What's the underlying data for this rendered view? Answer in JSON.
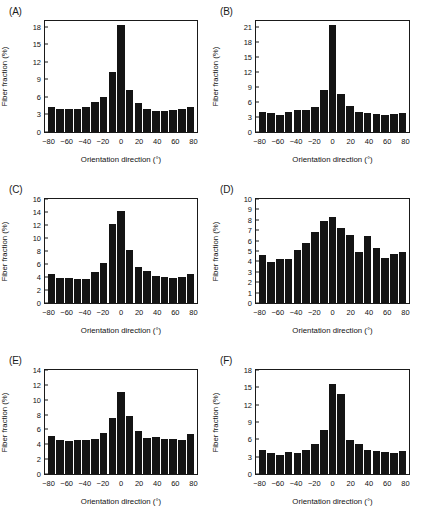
{
  "figure": {
    "panel_count": 6,
    "bin_centers": [
      -80,
      -70,
      -60,
      -50,
      -40,
      -30,
      -20,
      -10,
      0,
      10,
      20,
      30,
      40,
      50,
      60,
      70,
      80
    ]
  },
  "chart_data": [
    {
      "type": "bar",
      "panel": "(A)",
      "title": "",
      "xlabel": "Orientation direction (°)",
      "ylabel": "Fiber fraction (%)",
      "categories": [
        -80,
        -70,
        -60,
        -50,
        -40,
        -30,
        -20,
        -10,
        0,
        10,
        20,
        30,
        40,
        50,
        60,
        70,
        80
      ],
      "values": [
        4.2,
        3.9,
        3.9,
        3.9,
        4.3,
        5.1,
        6.0,
        10.2,
        18.3,
        7.2,
        4.9,
        4.0,
        3.6,
        3.6,
        3.8,
        3.9,
        4.2
      ],
      "ylim": [
        0,
        19
      ],
      "yticks": [
        0,
        3,
        6,
        9,
        12,
        15,
        18
      ],
      "xlim": [
        -85,
        85
      ],
      "xticks": [
        -80,
        -60,
        -40,
        -20,
        0,
        20,
        40,
        60,
        80
      ],
      "xtick_labels": [
        "−80",
        "−60",
        "−40",
        "−20",
        "0",
        "20",
        "40",
        "60",
        "80"
      ],
      "grid": false,
      "legend": "none",
      "bar_color": "#141414"
    },
    {
      "type": "bar",
      "panel": "(B)",
      "title": "",
      "xlabel": "Orientation direction (°)",
      "ylabel": "Fiber fraction (%)",
      "categories": [
        -80,
        -70,
        -60,
        -50,
        -40,
        -30,
        -20,
        -10,
        0,
        10,
        20,
        30,
        40,
        50,
        60,
        70,
        80
      ],
      "values": [
        4.0,
        3.9,
        3.5,
        4.0,
        4.4,
        4.5,
        5.1,
        8.5,
        21.4,
        7.7,
        5.3,
        4.0,
        3.9,
        3.7,
        3.5,
        3.7,
        3.9
      ],
      "ylim": [
        0,
        22.3
      ],
      "yticks": [
        0,
        3,
        6,
        9,
        12,
        15,
        18,
        21
      ],
      "xlim": [
        -85,
        85
      ],
      "xticks": [
        -80,
        -60,
        -40,
        -20,
        0,
        20,
        40,
        60,
        80
      ],
      "xtick_labels": [
        "−80",
        "−60",
        "−40",
        "−20",
        "0",
        "20",
        "40",
        "60",
        "80"
      ],
      "grid": false,
      "legend": "none",
      "bar_color": "#141414"
    },
    {
      "type": "bar",
      "panel": "(C)",
      "title": "",
      "xlabel": "Orientation direction (°)",
      "ylabel": "Fiber fraction (%)",
      "categories": [
        -80,
        -70,
        -60,
        -50,
        -40,
        -30,
        -20,
        -10,
        0,
        10,
        20,
        30,
        40,
        50,
        60,
        70,
        80
      ],
      "values": [
        4.4,
        3.8,
        3.8,
        3.7,
        3.65,
        4.8,
        6.15,
        12.1,
        14.2,
        8.15,
        5.5,
        5.0,
        4.1,
        3.95,
        3.8,
        4.05,
        4.5
      ],
      "ylim": [
        0,
        16
      ],
      "yticks": [
        0,
        2,
        4,
        6,
        8,
        10,
        12,
        14,
        16
      ],
      "xlim": [
        -85,
        85
      ],
      "xticks": [
        -80,
        -60,
        -40,
        -20,
        0,
        20,
        40,
        60,
        80
      ],
      "xtick_labels": [
        "−80",
        "−60",
        "−40",
        "−20",
        "0",
        "20",
        "40",
        "60",
        "80"
      ],
      "grid": false,
      "legend": "none",
      "bar_color": "#141414"
    },
    {
      "type": "bar",
      "panel": "(D)",
      "title": "",
      "xlabel": "Orientation direction (°)",
      "ylabel": "Fiber fraction (%)",
      "categories": [
        -80,
        -70,
        -60,
        -50,
        -40,
        -30,
        -20,
        -10,
        0,
        10,
        20,
        30,
        40,
        50,
        60,
        70,
        80
      ],
      "values": [
        4.6,
        3.95,
        4.25,
        4.2,
        5.1,
        5.75,
        6.8,
        7.9,
        8.25,
        7.2,
        6.5,
        4.9,
        6.45,
        5.25,
        4.3,
        4.75,
        4.9
      ],
      "ylim": [
        0,
        10
      ],
      "yticks": [
        0,
        1,
        2,
        3,
        4,
        5,
        6,
        7,
        8,
        9,
        10
      ],
      "xlim": [
        -85,
        85
      ],
      "xticks": [
        -80,
        -60,
        -40,
        -20,
        0,
        20,
        40,
        60,
        80
      ],
      "xtick_labels": [
        "−80",
        "−60",
        "−40",
        "−20",
        "0",
        "20",
        "40",
        "60",
        "80"
      ],
      "grid": false,
      "legend": "none",
      "bar_color": "#141414"
    },
    {
      "type": "bar",
      "panel": "(E)",
      "title": "",
      "xlabel": "Orientation direction (°)",
      "ylabel": "Fiber fraction (%)",
      "categories": [
        -80,
        -70,
        -60,
        -50,
        -40,
        -30,
        -20,
        -10,
        0,
        10,
        20,
        30,
        40,
        50,
        60,
        70,
        80
      ],
      "values": [
        5.1,
        4.6,
        4.45,
        4.6,
        4.55,
        4.7,
        5.55,
        7.5,
        11.1,
        7.8,
        5.75,
        4.85,
        5.0,
        4.7,
        4.7,
        4.55,
        5.35
      ],
      "ylim": [
        0,
        14
      ],
      "yticks": [
        0,
        2,
        4,
        6,
        8,
        10,
        12,
        14
      ],
      "xlim": [
        -85,
        85
      ],
      "xticks": [
        -80,
        -60,
        -40,
        -20,
        0,
        20,
        40,
        60,
        80
      ],
      "xtick_labels": [
        "−80",
        "−60",
        "−40",
        "−20",
        "0",
        "20",
        "40",
        "60",
        "80"
      ],
      "grid": false,
      "legend": "none",
      "bar_color": "#141414"
    },
    {
      "type": "bar",
      "panel": "(F)",
      "title": "",
      "xlabel": "Orientation direction (°)",
      "ylabel": "Fiber fraction (%)",
      "categories": [
        -80,
        -70,
        -60,
        -50,
        -40,
        -30,
        -20,
        -10,
        0,
        10,
        20,
        30,
        40,
        50,
        60,
        70,
        80
      ],
      "values": [
        4.2,
        3.7,
        3.35,
        3.8,
        3.7,
        4.1,
        5.25,
        7.6,
        15.6,
        13.9,
        5.9,
        5.2,
        4.1,
        3.9,
        3.85,
        3.65,
        3.9
      ],
      "ylim": [
        0,
        18
      ],
      "yticks": [
        0,
        3,
        6,
        9,
        12,
        15,
        18
      ],
      "xlim": [
        -85,
        85
      ],
      "xticks": [
        -80,
        -60,
        -40,
        -20,
        0,
        20,
        40,
        60,
        80
      ],
      "xtick_labels": [
        "−80",
        "−60",
        "−40",
        "−20",
        "0",
        "20",
        "40",
        "60",
        "80"
      ],
      "grid": false,
      "legend": "none",
      "bar_color": "#141414"
    }
  ]
}
